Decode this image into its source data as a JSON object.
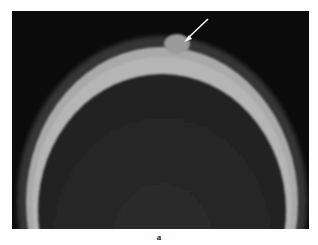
{
  "figure": {
    "panel_label": "a",
    "image": {
      "description": "Axial CT bone-window image of the skull vertex with a small rounded bony protrusion on the outer table",
      "annotation": "arrow-pointing-to-lesion"
    },
    "colors": {
      "background": "#ffffff",
      "image_background": "#0b0b0b",
      "bone": "#b8b8b8",
      "brain": "#2a2a2a",
      "scalp": "#3a3a3a",
      "arrow": "#f2f2f2"
    }
  }
}
